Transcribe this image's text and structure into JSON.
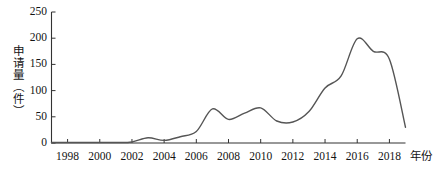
{
  "chart_data": {
    "type": "line",
    "title": "",
    "xlabel": "年份",
    "ylabel": "申请量（件）",
    "xlim": [
      1997,
      2019
    ],
    "ylim": [
      0,
      250
    ],
    "grid": false,
    "legend": null,
    "x_ticks": [
      "1998",
      "2000",
      "2002",
      "2004",
      "2006",
      "2008",
      "2010",
      "2012",
      "2014",
      "2016",
      "2018"
    ],
    "x_tick_values": [
      1998,
      2000,
      2002,
      2004,
      2006,
      2008,
      2010,
      2012,
      2014,
      2016,
      2018
    ],
    "y_ticks": [
      "0",
      "50",
      "100",
      "150",
      "200",
      "250"
    ],
    "y_tick_values": [
      0,
      50,
      100,
      150,
      200,
      250
    ],
    "line_color": "#555555",
    "line_width": 1.4,
    "axis_color": "#333333",
    "series": [
      {
        "name": "申请量",
        "x": [
          1997,
          1998,
          1999,
          2000,
          2001,
          2002,
          2003,
          2004,
          2005,
          2006,
          2007,
          2008,
          2009,
          2010,
          2011,
          2012,
          2013,
          2014,
          2015,
          2016,
          2017,
          2018,
          2019
        ],
        "values": [
          1,
          1,
          1,
          1,
          1,
          2,
          10,
          5,
          12,
          22,
          65,
          45,
          57,
          67,
          42,
          40,
          60,
          105,
          128,
          199,
          175,
          160,
          30
        ]
      }
    ]
  },
  "axes": {
    "y_axis_label": "申请量（件）",
    "x_axis_label": "年份"
  }
}
